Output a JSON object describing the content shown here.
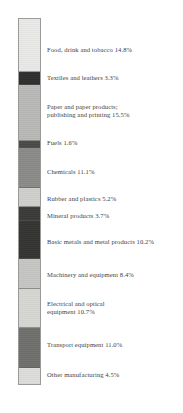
{
  "chart_data": {
    "type": "bar",
    "subtype": "stacked-bar-100pct-single",
    "orientation": "vertical",
    "title": "",
    "subtitle": "",
    "xlabel": "",
    "ylabel": "",
    "ylim": [
      0,
      100
    ],
    "grid": false,
    "legend_position": "right-inline-labels",
    "unit": "%",
    "categories": [
      "Food, drink and tobacco",
      "Textiles and leathers",
      "Paper and paper products; publishing and printing",
      "Fuels",
      "Chemicals",
      "Rubber and plastics",
      "Mineral products",
      "Basic metals and metal products",
      "Machinery and equipment",
      "Electrical and optical equipment",
      "Transport equipment",
      "Other manufacturing"
    ],
    "values": [
      14.8,
      3.3,
      15.5,
      1.6,
      11.1,
      5.2,
      3.7,
      10.2,
      8.4,
      10.7,
      11.0,
      4.5
    ],
    "segments": [
      {
        "name": "Food, drink and tobacco",
        "value": 14.8,
        "label_lines": [
          "Food, drink and tobacco 14.8%"
        ],
        "color": "#e9e9e7",
        "label_top": 46
      },
      {
        "name": "Textiles and leathers",
        "value": 3.3,
        "label_lines": [
          "Textiles and leathers 3.3%"
        ],
        "color": "#2e2e2e",
        "label_top": 74
      },
      {
        "name": "Paper and paper products; publishing and printing",
        "value": 15.5,
        "label_lines": [
          "Paper and paper products;",
          "publishing and printing 15.5%"
        ],
        "color": "#b9b9b7",
        "label_top": 103
      },
      {
        "name": "Fuels",
        "value": 1.6,
        "label_lines": [
          "Fuels 1.6%"
        ],
        "color": "#4a4a48",
        "label_top": 139
      },
      {
        "name": "Chemicals",
        "value": 11.1,
        "label_lines": [
          "Chemicals 11.1%"
        ],
        "color": "#8b8b89",
        "label_top": 168
      },
      {
        "name": "Rubber and plastics",
        "value": 5.2,
        "label_lines": [
          "Rubber and plastics 5.2%"
        ],
        "color": "#cfcfcd",
        "label_top": 195
      },
      {
        "name": "Mineral products",
        "value": 3.7,
        "label_lines": [
          "Mineral products 3.7%"
        ],
        "color": "#3a3a38",
        "label_top": 212
      },
      {
        "name": "Basic metals and metal products",
        "value": 10.2,
        "label_lines": [
          "Basic metals and metal products 10.2%"
        ],
        "color": "#343432",
        "label_top": 238
      },
      {
        "name": "Machinery and equipment",
        "value": 8.4,
        "label_lines": [
          "Machinery and equipment 8.4%"
        ],
        "color": "#c6c6c4",
        "label_top": 271
      },
      {
        "name": "Electrical and optical equipment",
        "value": 10.7,
        "label_lines": [
          "Electrical and optical",
          "equipment 10.7%"
        ],
        "color": "#d6d6d3",
        "label_top": 300
      },
      {
        "name": "Transport equipment",
        "value": 11.0,
        "label_lines": [
          "Transport equipment 11.0%"
        ],
        "color": "#6f6f6d",
        "label_top": 341
      },
      {
        "name": "Other manufacturing",
        "value": 4.5,
        "label_lines": [
          "Other manufacturing 4.5%"
        ],
        "color": "#dddddb",
        "label_top": 371
      }
    ]
  }
}
